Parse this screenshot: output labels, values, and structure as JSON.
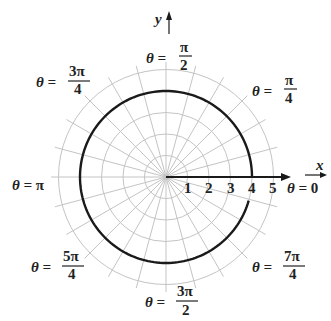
{
  "chart_data": {
    "type": "polar",
    "title": "",
    "curve": {
      "equation": "r = 4",
      "radius": 4,
      "theta_range_deg": [
        0,
        345
      ],
      "color": "#1a1a1a"
    },
    "grid": {
      "rings": [
        1,
        2,
        3,
        4,
        5
      ],
      "spoke_step_deg": 15,
      "color": "#bdbdbd"
    },
    "axes": {
      "x_label": "x",
      "y_label": "y"
    },
    "radial_tick_labels": [
      "1",
      "2",
      "3",
      "4",
      "5"
    ],
    "angle_labels": [
      {
        "theta": "0",
        "text_num": "0",
        "text_den": ""
      },
      {
        "theta": "π/4",
        "text_num": "π",
        "text_den": "4"
      },
      {
        "theta": "π/2",
        "text_num": "π",
        "text_den": "2"
      },
      {
        "theta": "3π/4",
        "text_num": "3π",
        "text_den": "4"
      },
      {
        "theta": "π",
        "text_num": "π",
        "text_den": ""
      },
      {
        "theta": "5π/4",
        "text_num": "5π",
        "text_den": "4"
      },
      {
        "theta": "3π/2",
        "text_num": "3π",
        "text_den": "2"
      },
      {
        "theta": "7π/4",
        "text_num": "7π",
        "text_den": "4"
      }
    ]
  },
  "labels": {
    "theta_eq": "θ =",
    "x": "x",
    "y": "y",
    "ticks": [
      "1",
      "2",
      "3",
      "4",
      "5"
    ],
    "t0": "0",
    "t45_num": "π",
    "t45_den": "4",
    "t90_num": "π",
    "t90_den": "2",
    "t135_num": "3π",
    "t135_den": "4",
    "t180": "π",
    "t225_num": "5π",
    "t225_den": "4",
    "t270_num": "3π",
    "t270_den": "2",
    "t315_num": "7π",
    "t315_den": "4"
  }
}
